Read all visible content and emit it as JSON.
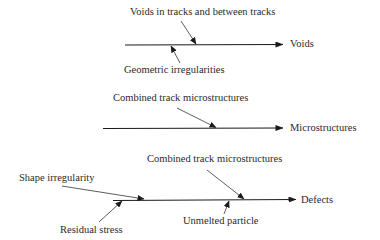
{
  "diagram": {
    "type": "cause-effect",
    "colors": {
      "line": "#1a1a1a",
      "text": "#2a2a2a",
      "background": "#ffffff"
    },
    "branches": [
      {
        "effect": "Voids",
        "causes": [
          {
            "label": "Voids in tracks and between tracks",
            "side": "above"
          },
          {
            "label": "Geometric irregularities",
            "side": "below"
          }
        ]
      },
      {
        "effect": "Microstructures",
        "causes": [
          {
            "label": "Combined track microstructures",
            "side": "above"
          }
        ]
      },
      {
        "effect": "Defects",
        "causes": [
          {
            "label": "Shape irregularity",
            "side": "above"
          },
          {
            "label": "Combined track microstructures",
            "side": "above"
          },
          {
            "label": "Residual stress",
            "side": "below"
          },
          {
            "label": "Unmelted particle",
            "side": "below"
          }
        ]
      }
    ]
  }
}
